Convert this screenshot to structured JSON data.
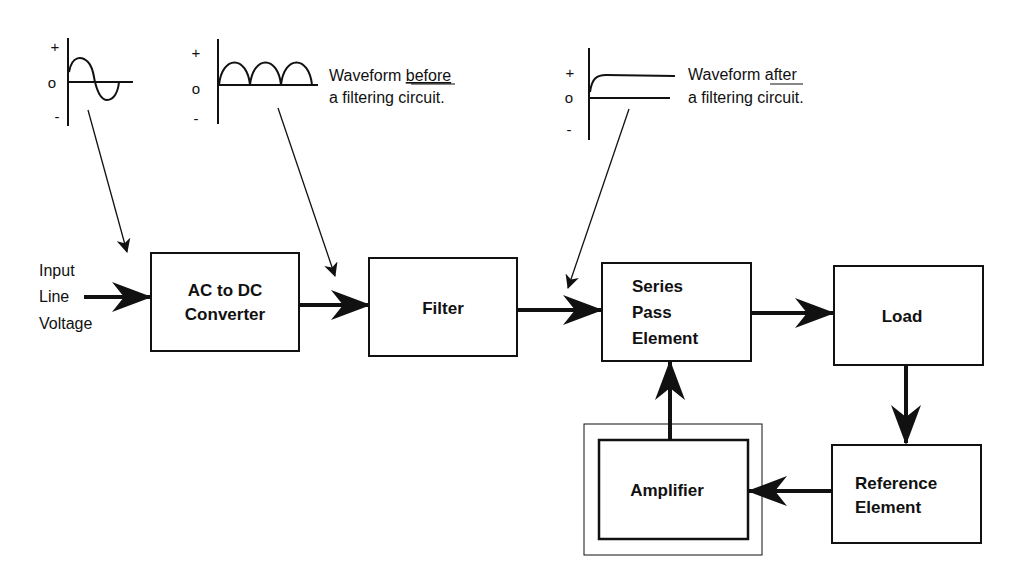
{
  "diagram": {
    "input_label": [
      "Input",
      "Line",
      "Voltage"
    ],
    "blocks": [
      {
        "id": "ac-dc",
        "lines": [
          "AC to DC",
          "Converter"
        ]
      },
      {
        "id": "filter",
        "lines": [
          "Filter"
        ]
      },
      {
        "id": "series-pass",
        "lines": [
          "Series",
          "Pass",
          "Element"
        ]
      },
      {
        "id": "load",
        "lines": [
          "Load"
        ]
      },
      {
        "id": "reference",
        "lines": [
          "Reference",
          "Element"
        ]
      },
      {
        "id": "amplifier",
        "lines": [
          "Amplifier"
        ]
      }
    ],
    "waveforms": [
      {
        "id": "ac-sine",
        "axis_labels": [
          "+",
          "o",
          "-"
        ]
      },
      {
        "id": "rectified",
        "axis_labels": [
          "+",
          "o",
          "-"
        ],
        "caption": {
          "line1_prefix": "Waveform ",
          "line1_emph": "before",
          "line2": "a filtering circuit."
        }
      },
      {
        "id": "filtered",
        "axis_labels": [
          "+",
          "o",
          "-"
        ],
        "caption": {
          "line1_prefix": "Waveform ",
          "line1_emph": "after",
          "line2": "a filtering circuit."
        }
      }
    ]
  }
}
